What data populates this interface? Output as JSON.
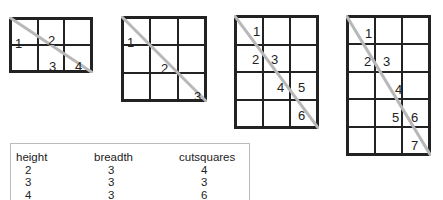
{
  "diagrams": [
    {
      "id": "grid-2x3",
      "rows": 2,
      "cols": 3,
      "x": 9,
      "y": 17,
      "w": 84,
      "h": 56,
      "labels": [
        {
          "text": "1",
          "r": 1,
          "c": 0
        },
        {
          "text": "2",
          "r": 0,
          "c": 1
        },
        {
          "text": "3",
          "r": 1,
          "c": 1
        },
        {
          "text": "4",
          "r": 1,
          "c": 2
        }
      ],
      "labels_pos": [
        {
          "text": "1",
          "x": 4,
          "y": 18
        },
        {
          "text": "2",
          "x": 37,
          "y": 15
        },
        {
          "text": "3",
          "x": 38,
          "y": 41
        },
        {
          "text": "4",
          "x": 64,
          "y": 41
        }
      ]
    },
    {
      "id": "grid-3x3",
      "rows": 3,
      "cols": 3,
      "x": 121,
      "y": 16,
      "w": 86,
      "h": 86,
      "labels_pos": [
        {
          "text": "1",
          "x": 4,
          "y": 18
        },
        {
          "text": "2",
          "x": 38,
          "y": 44
        },
        {
          "text": "3",
          "x": 71,
          "y": 72
        }
      ]
    },
    {
      "id": "grid-4x3",
      "rows": 4,
      "cols": 3,
      "x": 234,
      "y": 15,
      "w": 85,
      "h": 114,
      "labels_pos": [
        {
          "text": "1",
          "x": 17,
          "y": 8
        },
        {
          "text": "2",
          "x": 16,
          "y": 36
        },
        {
          "text": "3",
          "x": 35,
          "y": 36
        },
        {
          "text": "4",
          "x": 41,
          "y": 64
        },
        {
          "text": "5",
          "x": 62,
          "y": 64
        },
        {
          "text": "6",
          "x": 62,
          "y": 92
        }
      ]
    },
    {
      "id": "grid-5x3",
      "rows": 5,
      "cols": 3,
      "x": 346,
      "y": 15,
      "w": 85,
      "h": 141,
      "labels_pos": [
        {
          "text": "1",
          "x": 17,
          "y": 10
        },
        {
          "text": "2",
          "x": 16,
          "y": 38
        },
        {
          "text": "3",
          "x": 35,
          "y": 38
        },
        {
          "text": "4",
          "x": 47,
          "y": 66
        },
        {
          "text": "5",
          "x": 44,
          "y": 94
        },
        {
          "text": "6",
          "x": 63,
          "y": 94
        },
        {
          "text": "7",
          "x": 63,
          "y": 122
        }
      ]
    }
  ],
  "diagonal_color": "#b8b8b8",
  "table": {
    "headers": [
      "height",
      "breadth",
      "cutsquares"
    ],
    "rows": [
      [
        "2",
        "3",
        "4"
      ],
      [
        "3",
        "3",
        "3"
      ],
      [
        "4",
        "3",
        "6"
      ]
    ]
  }
}
